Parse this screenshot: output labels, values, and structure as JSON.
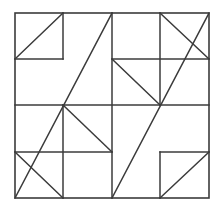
{
  "figure": {
    "canvas": {
      "width": 223,
      "height": 211
    },
    "colors": {
      "background": "#ffffff",
      "line": "#3b3b3b"
    },
    "geometry": {
      "x_ticks": [
        15,
        63,
        112,
        160,
        209
      ],
      "y_ticks": [
        13,
        59,
        105,
        152,
        198
      ],
      "stroke_width": 1.5
    },
    "frame": {
      "name": "outer-square",
      "x1": 15,
      "y1": 13,
      "x2": 209,
      "y2": 198
    },
    "grid_segments": [
      {
        "name": "tl-cell-right-edge",
        "x1": 63,
        "y1": 13,
        "x2": 63,
        "y2": 59
      },
      {
        "name": "tl-cell-bottom-edge",
        "x1": 15,
        "y1": 59,
        "x2": 63,
        "y2": 59
      },
      {
        "name": "quadrant-vertical-center",
        "x1": 112,
        "y1": 13,
        "x2": 112,
        "y2": 198
      },
      {
        "name": "quadrant-horizontal-center",
        "x1": 15,
        "y1": 105,
        "x2": 209,
        "y2": 105
      },
      {
        "name": "tr-quadrant-vertical",
        "x1": 160,
        "y1": 13,
        "x2": 160,
        "y2": 105
      },
      {
        "name": "tr-quadrant-horizontal",
        "x1": 112,
        "y1": 59,
        "x2": 209,
        "y2": 59
      },
      {
        "name": "bl-quadrant-vertical",
        "x1": 63,
        "y1": 105,
        "x2": 63,
        "y2": 198
      },
      {
        "name": "bl-quadrant-horizontal",
        "x1": 15,
        "y1": 152,
        "x2": 112,
        "y2": 152
      },
      {
        "name": "br-cell-left-edge",
        "x1": 160,
        "y1": 152,
        "x2": 160,
        "y2": 198
      },
      {
        "name": "br-cell-top-edge",
        "x1": 160,
        "y1": 152,
        "x2": 209,
        "y2": 152
      }
    ],
    "diagonal_segments": [
      {
        "name": "tl-small-diagonal",
        "x1": 15,
        "y1": 59,
        "x2": 63,
        "y2": 13
      },
      {
        "name": "tl-large-diagonal",
        "x1": 15,
        "y1": 198,
        "x2": 112,
        "y2": 13
      },
      {
        "name": "tr-upper-diagonal",
        "x1": 160,
        "y1": 13,
        "x2": 209,
        "y2": 59
      },
      {
        "name": "tr-lower-diagonal",
        "x1": 112,
        "y1": 59,
        "x2": 160,
        "y2": 105
      },
      {
        "name": "bl-upper-diagonal",
        "x1": 63,
        "y1": 105,
        "x2": 112,
        "y2": 152
      },
      {
        "name": "bl-lower-diagonal",
        "x1": 15,
        "y1": 152,
        "x2": 63,
        "y2": 198
      },
      {
        "name": "br-large-diagonal",
        "x1": 112,
        "y1": 198,
        "x2": 209,
        "y2": 13
      },
      {
        "name": "br-small-diagonal",
        "x1": 160,
        "y1": 198,
        "x2": 209,
        "y2": 152
      }
    ]
  }
}
